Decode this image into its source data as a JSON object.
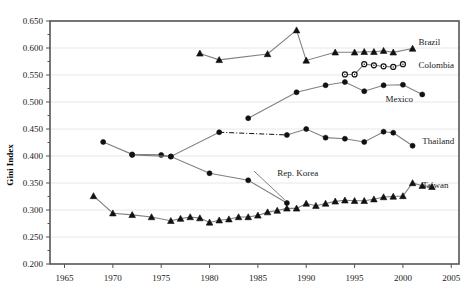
{
  "chart_data": {
    "type": "line",
    "title": "",
    "xlabel": "",
    "ylabel": "Gini Index",
    "xlim": [
      1963.5,
      2005.8
    ],
    "ylim": [
      0.2,
      0.65
    ],
    "xticks": [
      1965,
      1970,
      1975,
      1980,
      1985,
      1990,
      1995,
      2000,
      2005
    ],
    "yticks": [
      0.2,
      0.25,
      0.3,
      0.35,
      0.4,
      0.45,
      0.5,
      0.55,
      0.6,
      0.65
    ],
    "ytick_labels": [
      "0.200",
      "0.250",
      "0.300",
      "0.350",
      "0.400",
      "0.450",
      "0.500",
      "0.550",
      "0.600",
      "0.650"
    ],
    "xtick_labels": [
      "1965",
      "1970",
      "1975",
      "1980",
      "1985",
      "1990",
      "1995",
      "2000",
      "2005"
    ],
    "grid": "horizontal",
    "legend": "inline-right-of-series",
    "series": [
      {
        "name": "Brazil",
        "marker": "triangle",
        "line": "solid",
        "label_x": 2001.6,
        "label_y": 0.612,
        "points": [
          {
            "x": 1979,
            "y": 0.59
          },
          {
            "x": 1981,
            "y": 0.578
          },
          {
            "x": 1986,
            "y": 0.589
          },
          {
            "x": 1989,
            "y": 0.633
          },
          {
            "x": 1990,
            "y": 0.577
          },
          {
            "x": 1993,
            "y": 0.592
          },
          {
            "x": 1995,
            "y": 0.592
          },
          {
            "x": 1996,
            "y": 0.593
          },
          {
            "x": 1997,
            "y": 0.593
          },
          {
            "x": 1998,
            "y": 0.595
          },
          {
            "x": 1999,
            "y": 0.592
          },
          {
            "x": 2001,
            "y": 0.599
          }
        ]
      },
      {
        "name": "Colombia",
        "marker": "open-circle",
        "line": "solid",
        "label_x": 2001.6,
        "label_y": 0.568,
        "points": [
          {
            "x": 1994,
            "y": 0.551
          },
          {
            "x": 1995,
            "y": 0.551
          },
          {
            "x": 1996,
            "y": 0.57
          },
          {
            "x": 1997,
            "y": 0.568
          },
          {
            "x": 1998,
            "y": 0.566
          },
          {
            "x": 1999,
            "y": 0.565
          },
          {
            "x": 2000,
            "y": 0.57
          }
        ]
      },
      {
        "name": "Mexico",
        "marker": "circle",
        "line": "solid",
        "label_x": 1998.2,
        "label_y": 0.506,
        "points": [
          {
            "x": 1984,
            "y": 0.47
          },
          {
            "x": 1989,
            "y": 0.518
          },
          {
            "x": 1992,
            "y": 0.531
          },
          {
            "x": 1994,
            "y": 0.537
          },
          {
            "x": 1996,
            "y": 0.52
          },
          {
            "x": 1998,
            "y": 0.531
          },
          {
            "x": 2000,
            "y": 0.532
          },
          {
            "x": 2002,
            "y": 0.514
          }
        ]
      },
      {
        "name": "Thailand",
        "marker": "circle",
        "line": "solid-with-dashdot-gap",
        "label_x": 2002.0,
        "label_y": 0.427,
        "points": [
          {
            "x": 1969,
            "y": 0.426
          },
          {
            "x": 1972,
            "y": 0.403
          },
          {
            "x": 1975,
            "y": 0.402
          },
          {
            "x": 1976,
            "y": 0.399
          },
          {
            "x": 1981,
            "y": 0.444
          },
          {
            "x": 1988,
            "y": 0.439
          },
          {
            "x": 1990,
            "y": 0.45
          },
          {
            "x": 1992,
            "y": 0.434
          },
          {
            "x": 1994,
            "y": 0.432
          },
          {
            "x": 1996,
            "y": 0.426
          },
          {
            "x": 1998,
            "y": 0.445
          },
          {
            "x": 1999,
            "y": 0.443
          },
          {
            "x": 2001,
            "y": 0.419
          }
        ]
      },
      {
        "name": "Rep. Korea",
        "marker": "circle",
        "line": "solid",
        "label_x": 1987.0,
        "label_y": 0.368,
        "points": [
          {
            "x": 1972,
            "y": 0.402
          },
          {
            "x": 1976,
            "y": 0.399
          },
          {
            "x": 1980,
            "y": 0.368
          },
          {
            "x": 1984,
            "y": 0.355
          },
          {
            "x": 1988,
            "y": 0.313
          }
        ]
      },
      {
        "name": "Taiwan",
        "marker": "triangle",
        "line": "solid",
        "label_x": 2002.0,
        "label_y": 0.347,
        "points": [
          {
            "x": 1968,
            "y": 0.326
          },
          {
            "x": 1970,
            "y": 0.294
          },
          {
            "x": 1972,
            "y": 0.291
          },
          {
            "x": 1974,
            "y": 0.287
          },
          {
            "x": 1976,
            "y": 0.28
          },
          {
            "x": 1977,
            "y": 0.284
          },
          {
            "x": 1978,
            "y": 0.287
          },
          {
            "x": 1979,
            "y": 0.285
          },
          {
            "x": 1980,
            "y": 0.277
          },
          {
            "x": 1981,
            "y": 0.281
          },
          {
            "x": 1982,
            "y": 0.283
          },
          {
            "x": 1983,
            "y": 0.287
          },
          {
            "x": 1984,
            "y": 0.287
          },
          {
            "x": 1985,
            "y": 0.29
          },
          {
            "x": 1986,
            "y": 0.296
          },
          {
            "x": 1987,
            "y": 0.299
          },
          {
            "x": 1988,
            "y": 0.303
          },
          {
            "x": 1989,
            "y": 0.303
          },
          {
            "x": 1990,
            "y": 0.312
          },
          {
            "x": 1991,
            "y": 0.308
          },
          {
            "x": 1992,
            "y": 0.312
          },
          {
            "x": 1993,
            "y": 0.316
          },
          {
            "x": 1994,
            "y": 0.318
          },
          {
            "x": 1995,
            "y": 0.317
          },
          {
            "x": 1996,
            "y": 0.317
          },
          {
            "x": 1997,
            "y": 0.32
          },
          {
            "x": 1998,
            "y": 0.324
          },
          {
            "x": 1999,
            "y": 0.325
          },
          {
            "x": 2000,
            "y": 0.326
          },
          {
            "x": 2001,
            "y": 0.35
          },
          {
            "x": 2002,
            "y": 0.345
          },
          {
            "x": 2003,
            "y": 0.343
          }
        ]
      }
    ]
  },
  "colors": {
    "line": "#808080",
    "marker": "#111111",
    "grid": "#e8e8e8",
    "axis": "#555555",
    "text": "#1a1a1a"
  }
}
